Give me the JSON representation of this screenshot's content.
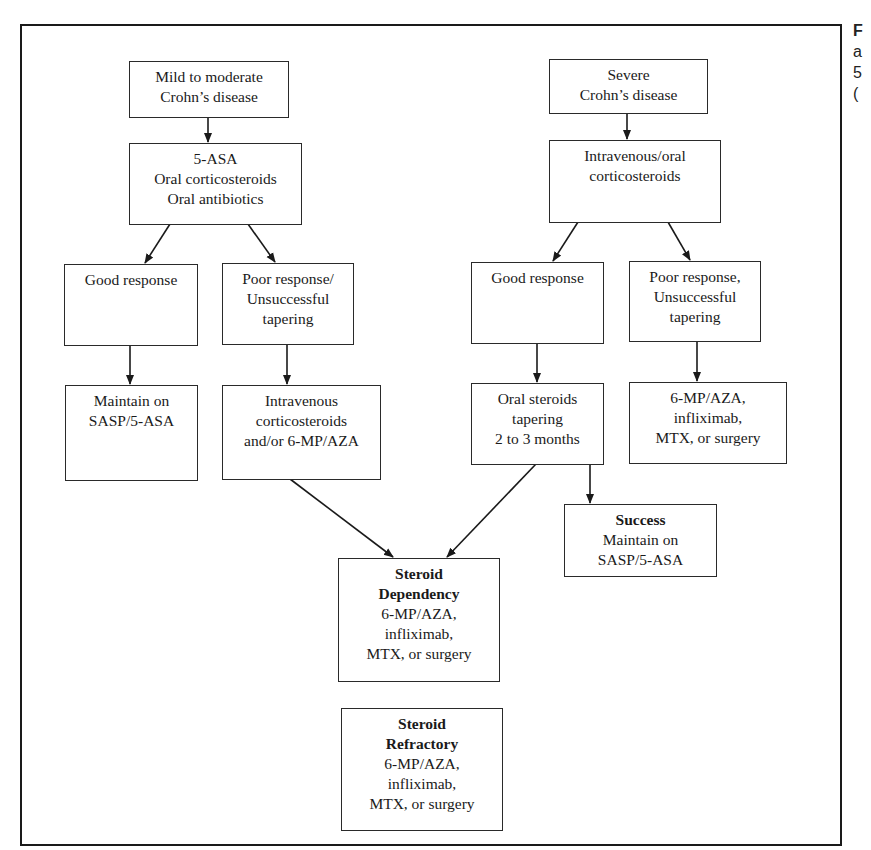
{
  "diagram": {
    "type": "flowchart",
    "nodes": {
      "mild": {
        "lines": [
          "Mild to moderate",
          "Crohn’s disease"
        ]
      },
      "first_line": {
        "lines": [
          "5-ASA",
          "Oral corticosteroids",
          "Oral antibiotics"
        ]
      },
      "good_left": {
        "lines": [
          "Good response"
        ]
      },
      "poor_left": {
        "lines": [
          "Poor response/",
          "Unsuccessful",
          "tapering"
        ]
      },
      "maintain_left": {
        "lines": [
          "Maintain on",
          "SASP/5-ASA"
        ]
      },
      "iv_left": {
        "lines": [
          "Intravenous",
          "corticosteroids",
          "and/or 6-MP/AZA"
        ]
      },
      "severe": {
        "lines": [
          "Severe",
          "Crohn’s disease"
        ]
      },
      "iv_oral": {
        "lines": [
          "Intravenous/oral",
          "corticosteroids"
        ]
      },
      "good_right": {
        "lines": [
          "Good response"
        ]
      },
      "poor_right": {
        "lines": [
          "Poor response,",
          "Unsuccessful",
          "tapering"
        ]
      },
      "oral_taper": {
        "lines": [
          "Oral steroids",
          "tapering",
          "2 to 3 months"
        ]
      },
      "alt_right": {
        "lines": [
          "6-MP/AZA,",
          "infliximab,",
          "MTX, or surgery"
        ]
      },
      "success": {
        "title": "Success",
        "lines": [
          "Maintain on",
          "SASP/5-ASA"
        ]
      },
      "dependency": {
        "title_lines": [
          "Steroid",
          "Dependency"
        ],
        "lines": [
          "6-MP/AZA,",
          "infliximab,",
          "MTX, or surgery"
        ]
      },
      "refractory": {
        "title_lines": [
          "Steroid",
          "Refractory"
        ],
        "lines": [
          "6-MP/AZA,",
          "infliximab,",
          "MTX, or surgery"
        ]
      }
    },
    "edges": [
      [
        "mild",
        "first_line"
      ],
      [
        "first_line",
        "good_left"
      ],
      [
        "first_line",
        "poor_left"
      ],
      [
        "good_left",
        "maintain_left"
      ],
      [
        "poor_left",
        "iv_left"
      ],
      [
        "iv_left",
        "dependency"
      ],
      [
        "severe",
        "iv_oral"
      ],
      [
        "iv_oral",
        "good_right"
      ],
      [
        "iv_oral",
        "poor_right"
      ],
      [
        "good_right",
        "oral_taper"
      ],
      [
        "poor_right",
        "alt_right"
      ],
      [
        "oral_taper",
        "dependency"
      ],
      [
        "oral_taper",
        "success"
      ]
    ]
  },
  "caption_fragment": {
    "lines": [
      "F",
      "a",
      "5",
      "("
    ]
  },
  "colors": {
    "line": "#1a1a1a",
    "background": "#ffffff"
  }
}
